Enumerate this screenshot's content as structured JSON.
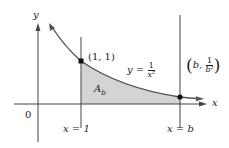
{
  "figure": {
    "axes": {
      "x_label": "x",
      "y_label": "y",
      "origin_label": "0"
    },
    "curve": {
      "equation_lhs": "y =",
      "numerator": "1",
      "denominator": "x²"
    },
    "points": [
      {
        "label": "(1, 1)"
      },
      {
        "label_open": "(",
        "label_b": "b,",
        "numerator": "1",
        "denominator": "b²",
        "label_close": ")"
      }
    ],
    "region": {
      "label": "A",
      "subscript": "b"
    },
    "vertical_lines": [
      {
        "label": "x = 1"
      },
      {
        "label": "x = b"
      }
    ],
    "colors": {
      "shade": "#d4d4d4",
      "curve": "#555555",
      "axis": "#444444",
      "point": "#111111"
    }
  }
}
